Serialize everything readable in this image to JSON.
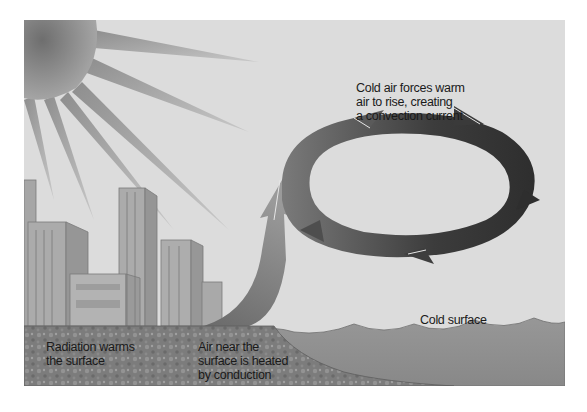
{
  "diagram": {
    "labels": {
      "convection": "Cold air forces warm\nair to rise, creating\na convection current",
      "radiation": "Radiation warms\nthe surface",
      "conduction": "Air near the\nsurface is heated\nby conduction",
      "cold_surface": "Cold surface"
    },
    "elements": [
      "sun-with-rays",
      "city-buildings",
      "warm-ground",
      "rising-air-arrow",
      "convection-loop-arrows",
      "cold-water-surface"
    ],
    "colors": {
      "sky": "#dcdcdc",
      "sun": "#8a8a8a",
      "buildings": "#a9a9a9",
      "ground": "#7d7d7d",
      "water": "#8f8f8f",
      "arrow_dark": "#3a3a3a",
      "arrow_light": "#8c8c8c",
      "text": "#1a1a1a"
    }
  }
}
